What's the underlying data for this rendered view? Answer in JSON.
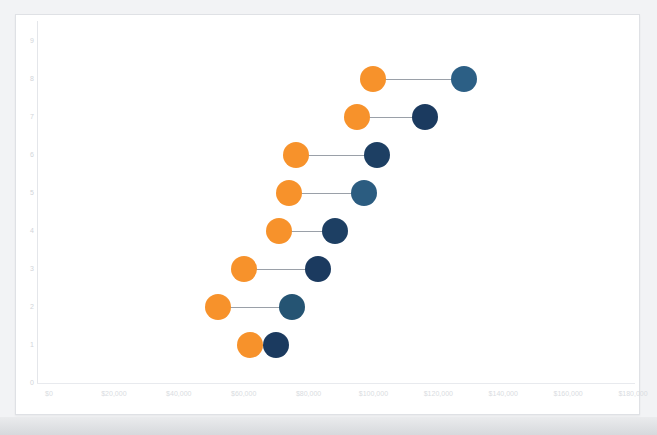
{
  "chart_data": {
    "type": "scatter",
    "subtype": "dumbbell",
    "title": "",
    "xlabel": "",
    "ylabel": "",
    "xlim": [
      0,
      180000
    ],
    "ylim": [
      0,
      9
    ],
    "grid": false,
    "legend": null,
    "x_ticks": [
      0,
      20000,
      40000,
      60000,
      80000,
      100000,
      120000,
      140000,
      160000,
      180000
    ],
    "x_tick_labels": [
      "$0",
      "$20,000",
      "$40,000",
      "$60,000",
      "$80,000",
      "$100,000",
      "$120,000",
      "$140,000",
      "$160,000",
      "$180,000"
    ],
    "y_ticks": [
      0,
      1,
      2,
      3,
      4,
      5,
      6,
      7,
      8,
      9
    ],
    "y_tick_labels": [
      "0",
      "1",
      "2",
      "3",
      "4",
      "5",
      "6",
      "7",
      "8",
      "9"
    ],
    "series": [
      {
        "name": "start",
        "color": "#f7922b",
        "values": [
          100000,
          95000,
          76000,
          74000,
          71000,
          60000,
          52000,
          62000
        ]
      },
      {
        "name": "end",
        "color": "#1b3a5f",
        "values": [
          128000,
          116000,
          101000,
          97000,
          88000,
          83000,
          75000,
          70000
        ]
      }
    ],
    "categories": [
      "8",
      "7",
      "6",
      "5",
      "4",
      "3",
      "2",
      "1"
    ],
    "points": [
      {
        "category": "8",
        "y_pos": 8,
        "start": 100000,
        "end": 128000,
        "start_color": "#f7922b",
        "end_color": "#2c5f85"
      },
      {
        "category": "7",
        "y_pos": 7,
        "start": 95000,
        "end": 116000,
        "start_color": "#f7922b",
        "end_color": "#1b3a5f"
      },
      {
        "category": "6",
        "y_pos": 6,
        "start": 76000,
        "end": 101000,
        "start_color": "#f7922b",
        "end_color": "#1d3f63"
      },
      {
        "category": "5",
        "y_pos": 5,
        "start": 74000,
        "end": 97000,
        "start_color": "#f7922b",
        "end_color": "#2b5c80"
      },
      {
        "category": "4",
        "y_pos": 4,
        "start": 71000,
        "end": 88000,
        "start_color": "#f7922b",
        "end_color": "#1d3f63"
      },
      {
        "category": "3",
        "y_pos": 3,
        "start": 60000,
        "end": 83000,
        "start_color": "#f7922b",
        "end_color": "#1b3a5f"
      },
      {
        "category": "2",
        "y_pos": 2,
        "start": 52000,
        "end": 75000,
        "start_color": "#f7922b",
        "end_color": "#255473"
      },
      {
        "category": "1",
        "y_pos": 1,
        "start": 62000,
        "end": 70000,
        "start_color": "#f7922b",
        "end_color": "#1b3a5f"
      }
    ],
    "connector_color": "#9aa0a8"
  },
  "colors": {
    "background": "#f2f3f5",
    "card": "#ffffff",
    "border": "#dfe1e5",
    "axis": "#e4e6ea",
    "tick_text": "#d9dce1",
    "orange": "#f7922b",
    "navy": "#1b3a5f",
    "steel": "#2c5f85"
  }
}
